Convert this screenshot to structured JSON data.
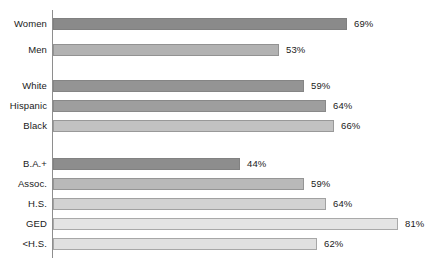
{
  "chart_data": {
    "type": "bar",
    "orientation": "horizontal",
    "title": "",
    "subtitle": "",
    "xlabel": "",
    "ylabel": "",
    "xlim": [
      0,
      81
    ],
    "grid": false,
    "legend": null,
    "value_suffix": "%",
    "px_per_unit": 4.26,
    "axis": {
      "color": "#8e8e8e",
      "left_px": 52,
      "top_px": 10,
      "height_px": 248
    },
    "groups": [
      {
        "name": "gender",
        "bars": [
          {
            "label": "Women",
            "value": 69,
            "value_label": "69%",
            "color": "#8a8a8a",
            "top_px": 18
          },
          {
            "label": "Men",
            "value": 53,
            "value_label": "53%",
            "color": "#b2b2b2",
            "top_px": 44
          }
        ]
      },
      {
        "name": "race-ethnicity",
        "bars": [
          {
            "label": "White",
            "value": 59,
            "value_label": "59%",
            "color": "#949494",
            "top_px": 80
          },
          {
            "label": "Hispanic",
            "value": 64,
            "value_label": "64%",
            "color": "#9e9e9e",
            "top_px": 100
          },
          {
            "label": "Black",
            "value": 66,
            "value_label": "66%",
            "color": "#c2c2c2",
            "top_px": 120
          }
        ]
      },
      {
        "name": "education",
        "bars": [
          {
            "label": "B.A.+",
            "value": 44,
            "value_label": "44%",
            "color": "#8d8d8d",
            "top_px": 158
          },
          {
            "label": "Assoc.",
            "value": 59,
            "value_label": "59%",
            "color": "#b9b9b9",
            "top_px": 178
          },
          {
            "label": "H.S.",
            "value": 64,
            "value_label": "64%",
            "color": "#d2d2d2",
            "top_px": 198
          },
          {
            "label": "GED",
            "value": 81,
            "value_label": "81%",
            "color": "#e4e4e4",
            "top_px": 218
          },
          {
            "label": "<H.S.",
            "value": 62,
            "value_label": "62%",
            "color": "#e0e0e0",
            "top_px": 238
          }
        ]
      }
    ]
  }
}
